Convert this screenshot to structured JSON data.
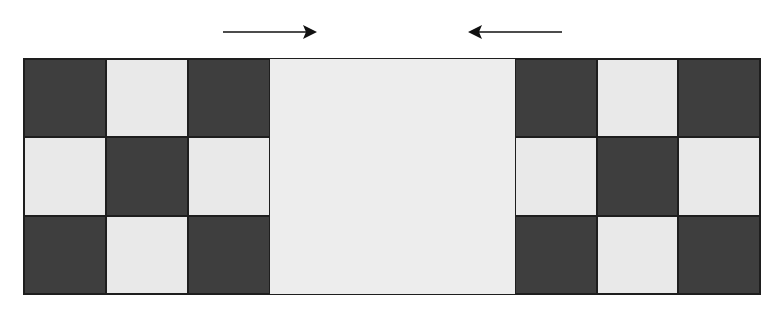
{
  "diagram": {
    "colors": {
      "dark": "#3e3e3e",
      "light": "#e9e9e9",
      "center": "#ededed",
      "border": "#1e1e1e",
      "arrow": "#111111"
    },
    "arrows": [
      {
        "direction": "right",
        "x1": 223,
        "x2": 317,
        "y": 32
      },
      {
        "direction": "left",
        "x1": 562,
        "x2": 468,
        "y": 32
      }
    ],
    "left_block": {
      "pattern": [
        [
          "dark",
          "light",
          "dark"
        ],
        [
          "light",
          "dark",
          "light"
        ],
        [
          "dark",
          "light",
          "dark"
        ]
      ]
    },
    "center_panel": {
      "fill": "light"
    },
    "right_block": {
      "pattern": [
        [
          "dark",
          "light",
          "dark"
        ],
        [
          "light",
          "dark",
          "light"
        ],
        [
          "dark",
          "light",
          "dark"
        ]
      ]
    }
  }
}
